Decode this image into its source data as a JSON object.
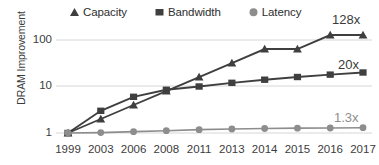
{
  "chart_data": {
    "type": "line",
    "title": "",
    "xlabel": "",
    "ylabel": "DRAM Improvement",
    "yscale": "log",
    "ylim": [
      0.8,
      200
    ],
    "yticks": [
      1,
      10,
      100
    ],
    "ytick_labels": [
      "1",
      "10",
      "100"
    ],
    "grid": "horizontal",
    "legend_position": "top",
    "categories": [
      "1999",
      "2003",
      "2006",
      "2008",
      "2011",
      "2013",
      "2014",
      "2015",
      "2016",
      "2017"
    ],
    "series": [
      {
        "name": "Capacity",
        "marker": "triangle",
        "color": "#3f3f3f",
        "values": [
          1,
          2,
          4,
          8,
          16,
          32,
          64,
          64,
          128,
          128
        ],
        "end_annotation": "128x"
      },
      {
        "name": "Bandwidth",
        "marker": "square",
        "color": "#3f3f3f",
        "values": [
          1,
          3,
          6,
          8.5,
          10,
          12,
          14,
          16,
          18,
          20
        ],
        "end_annotation": "20x"
      },
      {
        "name": "Latency",
        "marker": "circle",
        "color": "#8d8d8d",
        "values": [
          1,
          1.02,
          1.07,
          1.12,
          1.18,
          1.22,
          1.25,
          1.27,
          1.28,
          1.3
        ],
        "end_annotation": "1.3x"
      }
    ],
    "annotations": [
      {
        "text": "128x",
        "series": "Capacity"
      },
      {
        "text": "20x",
        "series": "Bandwidth"
      },
      {
        "text": "1.3x",
        "series": "Latency"
      }
    ]
  },
  "legend": {
    "items": [
      {
        "label": "Capacity",
        "icon": "triangle-marker-icon"
      },
      {
        "label": "Bandwidth",
        "icon": "square-marker-icon"
      },
      {
        "label": "Latency",
        "icon": "circle-marker-icon"
      }
    ]
  },
  "axes": {
    "y_title": "DRAM Improvement",
    "y_tick_labels": [
      "100",
      "10",
      "1"
    ],
    "x_tick_labels": [
      "1999",
      "2003",
      "2006",
      "2008",
      "2011",
      "2013",
      "2014",
      "2015",
      "2016",
      "2017"
    ]
  },
  "colors": {
    "dark_series": "#3f3f3f",
    "light_series": "#8d8d8d",
    "gridline": "#d6d6d6",
    "text": "#3c3c3c",
    "background": "#ffffff"
  }
}
